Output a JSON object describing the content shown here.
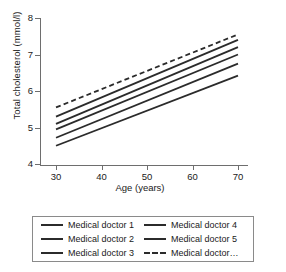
{
  "chart_data": {
    "type": "line",
    "title": "",
    "xlabel": "Age (years)",
    "ylabel": "Total cholesterol (mmol/l)",
    "xlim": [
      25,
      74
    ],
    "ylim": [
      4,
      8
    ],
    "xticks": [
      30,
      40,
      50,
      60,
      70
    ],
    "yticks": [
      4,
      5,
      6,
      7,
      8
    ],
    "grid": false,
    "legend_position": "bottom",
    "x": [
      30,
      70
    ],
    "series": [
      {
        "name": "Medical doctor 1",
        "style": "solid",
        "values": [
          5.3,
          7.4
        ]
      },
      {
        "name": "Medical doctor 2",
        "style": "solid",
        "values": [
          5.1,
          7.2
        ]
      },
      {
        "name": "Medical doctor 3",
        "style": "solid",
        "values": [
          4.95,
          7.0
        ]
      },
      {
        "name": "Medical doctor 4",
        "style": "solid",
        "values": [
          4.72,
          6.75
        ]
      },
      {
        "name": "Medical doctor 5",
        "style": "solid",
        "values": [
          4.5,
          6.42
        ]
      },
      {
        "name": "Medical doctor…",
        "style": "dashed",
        "values": [
          5.55,
          7.55
        ]
      }
    ]
  },
  "legend": {
    "entries": [
      {
        "label": "Medical doctor 1",
        "style": "solid"
      },
      {
        "label": "Medical doctor 2",
        "style": "solid"
      },
      {
        "label": "Medical doctor 3",
        "style": "solid"
      },
      {
        "label": "Medical doctor 4",
        "style": "solid"
      },
      {
        "label": "Medical doctor 5",
        "style": "solid"
      },
      {
        "label": "Medical doctor…",
        "style": "dashed"
      }
    ]
  },
  "colors": {
    "line": "#2b2b2b",
    "axis": "#6e6e6e",
    "text": "#1a1a1a",
    "legend_border": "#8a8a8a",
    "background": "#ffffff"
  }
}
